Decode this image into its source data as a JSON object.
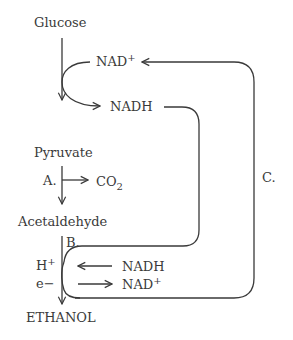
{
  "diagram": {
    "nodes": {
      "glucose": "Glucose",
      "pyruvate": "Pyruvate",
      "acetaldehyde": "Acetaldehyde",
      "ethanol": "ETHANOL"
    },
    "cofactors": {
      "nad_top": "NAD",
      "nad_top_sup": "+",
      "nadh_top": "NADH",
      "nadh_bottom": "NADH",
      "nad_bottom": "NAD",
      "nad_bottom_sup": "+",
      "co2": "CO",
      "co2_sub": "2",
      "h_plus": "H",
      "h_plus_sup": "+",
      "e_minus": "e−"
    },
    "step_labels": {
      "a": "A.",
      "b": "B.",
      "c": "C."
    },
    "colors": {
      "stroke": "#3a3a3a",
      "background": "#ffffff"
    }
  }
}
